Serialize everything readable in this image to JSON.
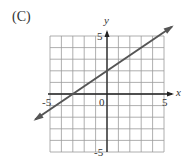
{
  "panel_label": "(C)",
  "chart_data": {
    "type": "line",
    "title": "(C)",
    "xlabel": "x",
    "ylabel": "y",
    "xlim": [
      -5,
      5
    ],
    "ylim": [
      -5,
      5
    ],
    "grid": true,
    "tick_labels": {
      "x_min": "-5",
      "x_max": "5",
      "origin": "0",
      "y_max": "5",
      "y_min": "-5"
    },
    "series": [
      {
        "name": "line",
        "equation": "y = (2/3)x + 2",
        "slope": 0.6667,
        "intercept": 2,
        "x": [
          -6,
          -3,
          0,
          3,
          6
        ],
        "y": [
          -2,
          0,
          2,
          4,
          6
        ]
      }
    ],
    "colors": {
      "line": "#555555",
      "grid": "#999999",
      "axis": "#222222"
    }
  }
}
